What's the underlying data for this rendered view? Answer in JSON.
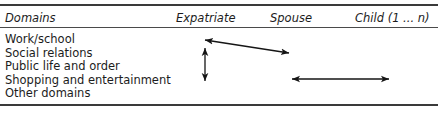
{
  "figure": {
    "type": "table-diagram",
    "background_color": "#ffffff",
    "rule_color": "#3a3a3a",
    "text_color": "#1c1c1c",
    "arrow_color": "#151515"
  },
  "table": {
    "columns": [
      {
        "id": "domains",
        "label": "Domains",
        "italic": true
      },
      {
        "id": "expatriate",
        "label": "Expatriate",
        "italic": true
      },
      {
        "id": "spouse",
        "label": "Spouse",
        "italic": true
      },
      {
        "id": "child",
        "label": "Child (1 ... n)",
        "italic": true
      }
    ],
    "rows": [
      {
        "label": "Work/school"
      },
      {
        "label": "Social relations"
      },
      {
        "label": "Public life and order"
      },
      {
        "label": "Shopping and entertainment"
      },
      {
        "label": "Other domains"
      }
    ]
  },
  "arrows": [
    {
      "id": "expatriate-spouse-diagonal",
      "name": "diagonal double-headed arrow from Expatriate to Spouse",
      "direction": "bidirectional",
      "x1": 205,
      "y1": 40,
      "x2": 289,
      "y2": 53
    },
    {
      "id": "expatriate-vertical",
      "name": "vertical double-headed arrow within Expatriate column",
      "direction": "bidirectional",
      "x1": 205,
      "y1": 48,
      "x2": 205,
      "y2": 81
    },
    {
      "id": "spouse-child-horizontal",
      "name": "horizontal double-headed arrow from Spouse to Child",
      "direction": "bidirectional",
      "x1": 292,
      "y1": 79,
      "x2": 389,
      "y2": 79
    }
  ]
}
